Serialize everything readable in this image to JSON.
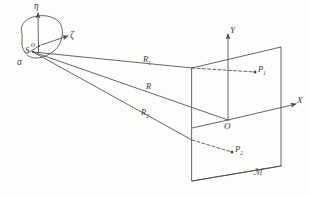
{
  "figure": {
    "ink_color": "#4a4a4a",
    "background": "#fdfdfb"
  },
  "source_patch": {
    "name": "sigma-surface-patch",
    "area_label": "σ",
    "origin_label": "o",
    "source_point_label": "S",
    "axes": [
      {
        "name": "eta",
        "label": "η",
        "direction": "up"
      },
      {
        "name": "zeta",
        "label": "ζ",
        "direction": "right-up"
      }
    ]
  },
  "receiving_plane": {
    "name": "receiving-plane",
    "plane_label": "ℳ",
    "origin_label": "O",
    "axes": [
      {
        "name": "Y",
        "label": "Y",
        "direction": "up"
      },
      {
        "name": "X",
        "label": "X",
        "direction": "right"
      }
    ],
    "points": [
      {
        "name": "P1",
        "label": "P",
        "subscript": "1"
      },
      {
        "name": "P2",
        "label": "P",
        "subscript": "2"
      }
    ]
  },
  "rays": [
    {
      "name": "R1",
      "label": "R",
      "subscript": "1",
      "from": "S",
      "to": "P1"
    },
    {
      "name": "R",
      "label": "R",
      "subscript": "",
      "from": "S",
      "to": "O"
    },
    {
      "name": "R2",
      "label": "R",
      "subscript": "2",
      "from": "S",
      "to": "P2"
    }
  ]
}
